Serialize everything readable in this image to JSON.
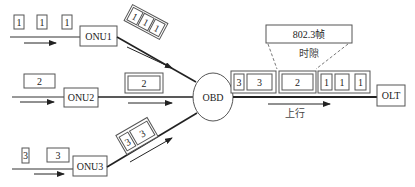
{
  "nodes": {
    "onu1": "ONU1",
    "onu2": "ONU2",
    "onu3": "ONU3",
    "obd": "OBD",
    "olt": "OLT"
  },
  "input_packets": {
    "onu1": [
      "1",
      "1",
      "1"
    ],
    "onu2": [
      "2"
    ],
    "onu3": [
      "3",
      "3"
    ]
  },
  "branch_frames": {
    "onu1": [
      "1",
      "1",
      "1"
    ],
    "onu2": [
      "2"
    ],
    "onu3": [
      "3",
      "3"
    ]
  },
  "trunk_frame": {
    "groups": [
      {
        "cells": [
          "3",
          "3"
        ]
      },
      {
        "cells": [
          "2"
        ]
      },
      {
        "cells": [
          "1",
          "1",
          "1"
        ]
      }
    ]
  },
  "callout": {
    "frame_label": "802.3帧",
    "slot_label": "时隙"
  },
  "direction_label": "上行",
  "colors": {
    "line": "#222222",
    "box_stroke": "#555555",
    "text": "#222222"
  }
}
